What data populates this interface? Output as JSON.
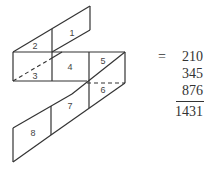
{
  "diagram": {
    "cells": [
      "1",
      "2",
      "3",
      "4",
      "5",
      "6",
      "7",
      "8"
    ],
    "equation": {
      "equals": "=",
      "addends": [
        "210",
        "345",
        "876"
      ],
      "sum": "1431"
    }
  }
}
